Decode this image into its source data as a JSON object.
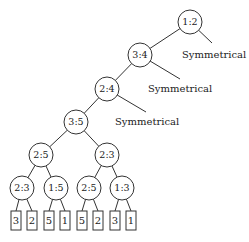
{
  "diagram": {
    "type": "decision-tree",
    "nodes": [
      {
        "id": "n1",
        "label": "1:2",
        "x": 190,
        "y": 22
      },
      {
        "id": "n2",
        "label": "3:4",
        "x": 140,
        "y": 55
      },
      {
        "id": "n3",
        "label": "2:4",
        "x": 107,
        "y": 89
      },
      {
        "id": "n4",
        "label": "3:5",
        "x": 76,
        "y": 122
      },
      {
        "id": "n5",
        "label": "2:5",
        "x": 41,
        "y": 155
      },
      {
        "id": "n6",
        "label": "2:3",
        "x": 107,
        "y": 155
      },
      {
        "id": "n7",
        "label": "2:3",
        "x": 22,
        "y": 188
      },
      {
        "id": "n8",
        "label": "1:5",
        "x": 56,
        "y": 188
      },
      {
        "id": "n9",
        "label": "2:5",
        "x": 89,
        "y": 188
      },
      {
        "id": "n10",
        "label": "1:3",
        "x": 122,
        "y": 188
      }
    ],
    "symmetric_branches": [
      {
        "from": "n1",
        "label": "Symmetrical",
        "line_end_x": 212,
        "line_end_y": 43,
        "text_x": 182,
        "text_y": 58
      },
      {
        "from": "n2",
        "label": "Symmetrical",
        "line_end_x": 180,
        "line_end_y": 79,
        "text_x": 148,
        "text_y": 92
      },
      {
        "from": "n3",
        "label": "Symmetrical",
        "line_end_x": 146,
        "line_end_y": 112,
        "text_x": 115,
        "text_y": 125
      }
    ],
    "leaves": [
      {
        "label": "3",
        "x": 16,
        "parent": "n7"
      },
      {
        "label": "2",
        "x": 32,
        "parent": "n7"
      },
      {
        "label": "5",
        "x": 49,
        "parent": "n8"
      },
      {
        "label": "1",
        "x": 65,
        "parent": "n8"
      },
      {
        "label": "5",
        "x": 82,
        "parent": "n9"
      },
      {
        "label": "2",
        "x": 98,
        "parent": "n9"
      },
      {
        "label": "3",
        "x": 115,
        "parent": "n10"
      },
      {
        "label": "1",
        "x": 131,
        "parent": "n10"
      }
    ],
    "edges": [
      [
        "n1",
        "n2"
      ],
      [
        "n2",
        "n3"
      ],
      [
        "n3",
        "n4"
      ],
      [
        "n4",
        "n5"
      ],
      [
        "n4",
        "n6"
      ],
      [
        "n5",
        "n7"
      ],
      [
        "n5",
        "n8"
      ],
      [
        "n6",
        "n9"
      ],
      [
        "n6",
        "n10"
      ]
    ],
    "node_radius": 12,
    "leaf_box": {
      "width": 10,
      "height": 19,
      "top": 211
    }
  }
}
